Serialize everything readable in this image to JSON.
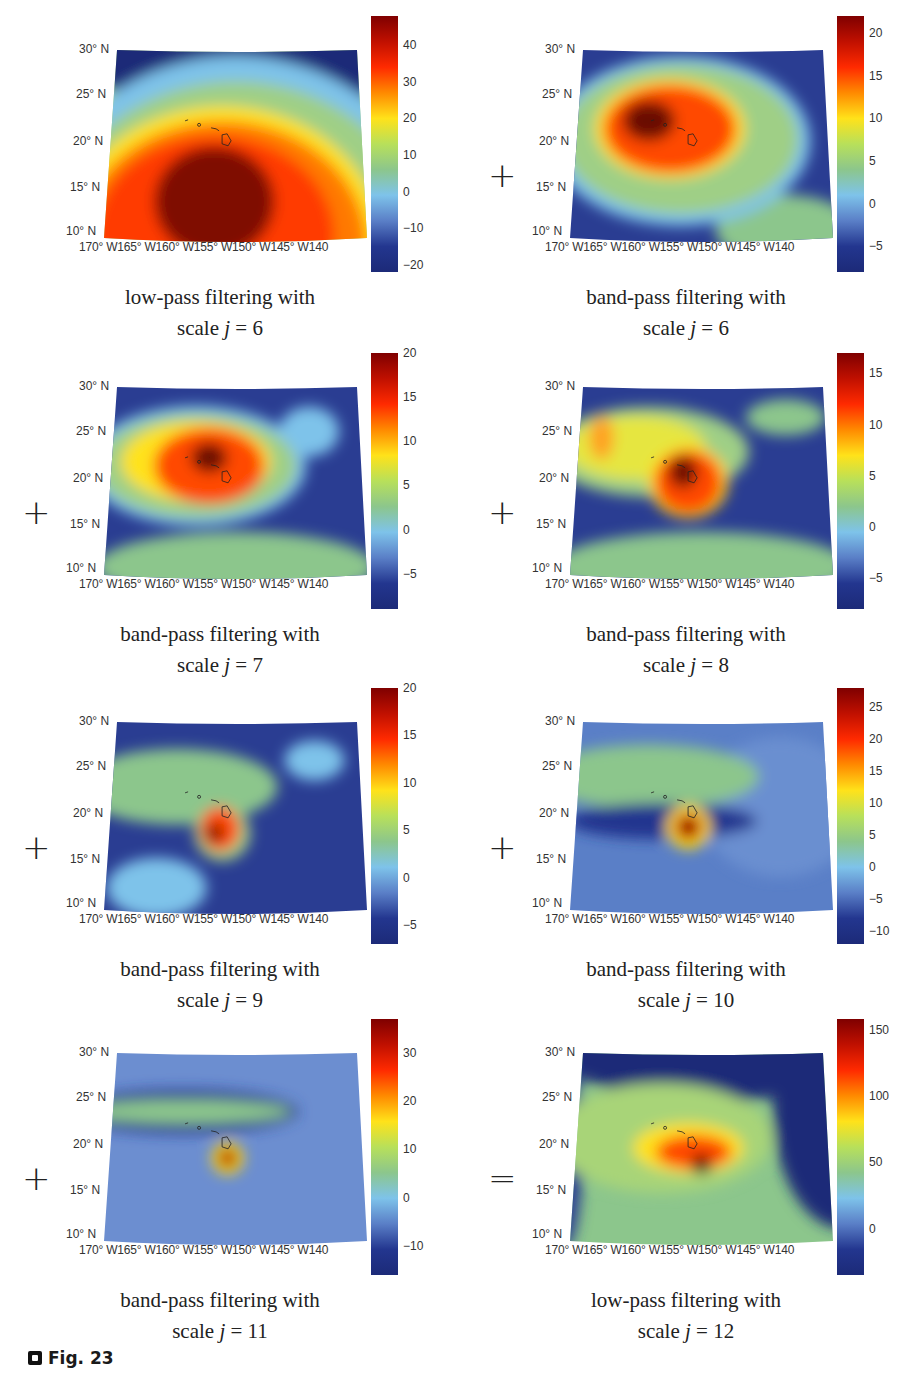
{
  "figure": {
    "label": "Fig. 23"
  },
  "axes": {
    "lat_ticks": [
      "30° N",
      "25° N",
      "20° N",
      "15° N",
      "10° N"
    ],
    "lon_ticks": "170° W165° W160° W155° W150° W145° W140"
  },
  "panels": [
    {
      "id": "lp6",
      "caption_line1": "low-pass filtering with",
      "caption_prefix": "scale ",
      "caption_j": "j",
      "caption_suffix": " = 6",
      "operator": "",
      "cbar_ticks": [
        "40",
        "30",
        "20",
        "10",
        "0",
        "−10",
        "−20"
      ],
      "cbar_min": -22,
      "cbar_max": 48
    },
    {
      "id": "bp6",
      "caption_line1": "band-pass filtering with",
      "caption_prefix": "scale ",
      "caption_j": "j",
      "caption_suffix": " = 6",
      "operator": "+",
      "cbar_ticks": [
        "20",
        "15",
        "10",
        "5",
        "0",
        "−5"
      ],
      "cbar_min": -8,
      "cbar_max": 22
    },
    {
      "id": "bp7",
      "caption_line1": "band-pass filtering with",
      "caption_prefix": "scale ",
      "caption_j": "j",
      "caption_suffix": " = 7",
      "operator": "+",
      "cbar_ticks": [
        "20",
        "15",
        "10",
        "5",
        "0",
        "−5"
      ],
      "cbar_min": -9,
      "cbar_max": 20
    },
    {
      "id": "bp8",
      "caption_line1": "band-pass filtering with",
      "caption_prefix": "scale ",
      "caption_j": "j",
      "caption_suffix": " = 8",
      "operator": "+",
      "cbar_ticks": [
        "15",
        "10",
        "5",
        "0",
        "−5"
      ],
      "cbar_min": -8,
      "cbar_max": 17
    },
    {
      "id": "bp9",
      "caption_line1": "band-pass filtering with",
      "caption_prefix": "scale ",
      "caption_j": "j",
      "caption_suffix": " = 9",
      "operator": "+",
      "cbar_ticks": [
        "20",
        "15",
        "10",
        "5",
        "0",
        "−5"
      ],
      "cbar_min": -7,
      "cbar_max": 20
    },
    {
      "id": "bp10",
      "caption_line1": "band-pass filtering with",
      "caption_prefix": "scale ",
      "caption_j": "j",
      "caption_suffix": " = 10",
      "operator": "+",
      "cbar_ticks": [
        "25",
        "20",
        "15",
        "10",
        "5",
        "0",
        "−5",
        "−10"
      ],
      "cbar_min": -12,
      "cbar_max": 28
    },
    {
      "id": "bp11",
      "caption_line1": "band-pass filtering with",
      "caption_prefix": "scale ",
      "caption_j": "j",
      "caption_suffix": " = 11",
      "operator": "+",
      "cbar_ticks": [
        "30",
        "20",
        "10",
        "0",
        "−10"
      ],
      "cbar_min": -16,
      "cbar_max": 37
    },
    {
      "id": "lp12",
      "caption_line1": "low-pass filtering with",
      "caption_prefix": "scale ",
      "caption_j": "j",
      "caption_suffix": " = 12",
      "operator": "=",
      "cbar_ticks": [
        "150",
        "100",
        "50",
        "0"
      ],
      "cbar_min": -35,
      "cbar_max": 158
    }
  ],
  "chart_data": {
    "type": "heatmap",
    "region": {
      "lat": [
        10,
        30
      ],
      "lon": [
        -170,
        -140
      ],
      "lat_unit": "° N",
      "lon_unit": "° W"
    },
    "xlabel": "",
    "ylabel": "",
    "x_ticks": [
      "170° W",
      "165° W",
      "160° W",
      "155° W",
      "150° W",
      "145° W",
      "140"
    ],
    "y_ticks": [
      "30° N",
      "25° N",
      "20° N",
      "15° N",
      "10° N"
    ],
    "colormap": "jet",
    "equation": "lp(j=6) + bp(j=6) + bp(j=7) + bp(j=8) + bp(j=9) + bp(j=10) + bp(j=11) = lp(j=12)",
    "panels": [
      {
        "name": "low-pass filtering with scale j = 6",
        "scale_j": 6,
        "filter": "low-pass",
        "colorbar_ticks": [
          40,
          30,
          20,
          10,
          0,
          -10,
          -20
        ],
        "colorbar_range": [
          -22,
          48
        ],
        "peak_approx": {
          "lat": 14,
          "lon": -156,
          "value": 48
        }
      },
      {
        "name": "band-pass filtering with scale j = 6",
        "scale_j": 6,
        "filter": "band-pass",
        "colorbar_ticks": [
          20,
          15,
          10,
          5,
          0,
          -5
        ],
        "colorbar_range": [
          -8,
          22
        ],
        "peak_approx": {
          "lat": 22,
          "lon": -159,
          "value": 22
        }
      },
      {
        "name": "band-pass filtering with scale j = 7",
        "scale_j": 7,
        "filter": "band-pass",
        "colorbar_ticks": [
          20,
          15,
          10,
          5,
          0,
          -5
        ],
        "colorbar_range": [
          -9,
          20
        ],
        "peak_approx": {
          "lat": 21,
          "lon": -157,
          "value": 20
        }
      },
      {
        "name": "band-pass filtering with scale j = 8",
        "scale_j": 8,
        "filter": "band-pass",
        "colorbar_ticks": [
          15,
          10,
          5,
          0,
          -5
        ],
        "colorbar_range": [
          -8,
          17
        ],
        "peak_approx": {
          "lat": 20,
          "lon": -156,
          "value": 17
        }
      },
      {
        "name": "band-pass filtering with scale j = 9",
        "scale_j": 9,
        "filter": "band-pass",
        "colorbar_ticks": [
          20,
          15,
          10,
          5,
          0,
          -5
        ],
        "colorbar_range": [
          -7,
          20
        ],
        "peak_approx": {
          "lat": 19.5,
          "lon": -156,
          "value": 20
        }
      },
      {
        "name": "band-pass filtering with scale j = 10",
        "scale_j": 10,
        "filter": "band-pass",
        "colorbar_ticks": [
          25,
          20,
          15,
          10,
          5,
          0,
          -5,
          -10
        ],
        "colorbar_range": [
          -12,
          28
        ],
        "peak_approx": {
          "lat": 19.5,
          "lon": -155.5,
          "value": 28
        }
      },
      {
        "name": "band-pass filtering with scale j = 11",
        "scale_j": 11,
        "filter": "band-pass",
        "colorbar_ticks": [
          30,
          20,
          10,
          0,
          -10
        ],
        "colorbar_range": [
          -16,
          37
        ],
        "peak_approx": {
          "lat": 19.5,
          "lon": -155.5,
          "value": 37
        }
      },
      {
        "name": "low-pass filtering with scale j = 12",
        "scale_j": 12,
        "filter": "low-pass",
        "colorbar_ticks": [
          150,
          100,
          50,
          0
        ],
        "colorbar_range": [
          -35,
          158
        ],
        "peak_approx": {
          "lat": 19.5,
          "lon": -155.5,
          "value": 158
        }
      }
    ]
  }
}
